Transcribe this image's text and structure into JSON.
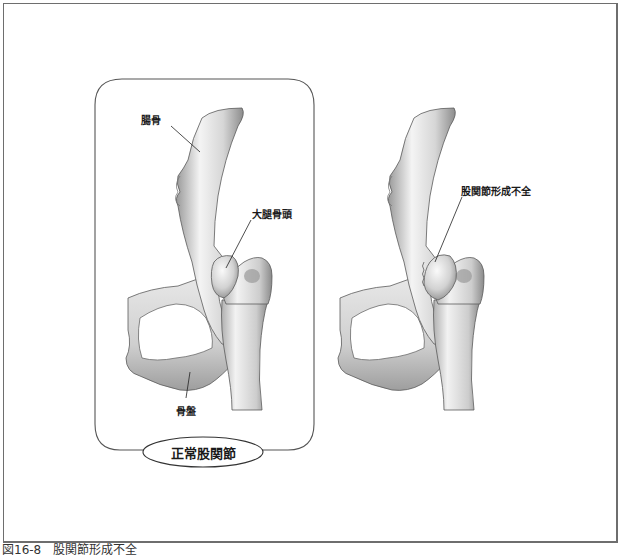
{
  "figure": {
    "caption": "図16-8　股関節形成不全",
    "panels": [
      {
        "id": "normal",
        "title": "正常股関節",
        "labels": {
          "ilium": "腸骨",
          "femoral_head": "大腿骨頭",
          "pelvis": "骨盤"
        }
      },
      {
        "id": "dysplasia",
        "labels": {
          "hip_dysplasia": "股関節形成不全"
        }
      }
    ]
  },
  "colors": {
    "frame_border": "#6e6e6e",
    "bone_light": "#f2f2f2",
    "bone_mid": "#c8c8c8",
    "bone_dark": "#8a8a8a",
    "outline": "#4a4a4a",
    "text": "#1a1a1a"
  }
}
